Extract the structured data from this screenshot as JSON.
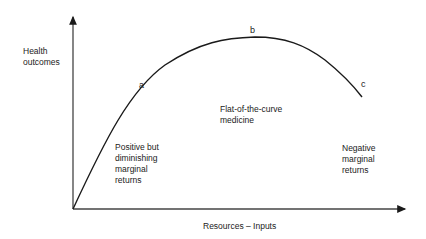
{
  "diagram": {
    "y_axis_label": [
      "Health",
      "outcomes"
    ],
    "x_axis_label": "Resources – Inputs",
    "points": {
      "a": "a",
      "b": "b",
      "c": "c"
    },
    "regions": {
      "left": [
        "Positive but",
        "diminishing",
        "marginal",
        "returns"
      ],
      "middle": [
        "Flat-of-the-curve",
        "medicine"
      ],
      "right": [
        "Negative",
        "marginal",
        "returns"
      ]
    },
    "colors": {
      "axis": "#444444",
      "curve": "#1a1a1a",
      "text": "#222222"
    }
  }
}
